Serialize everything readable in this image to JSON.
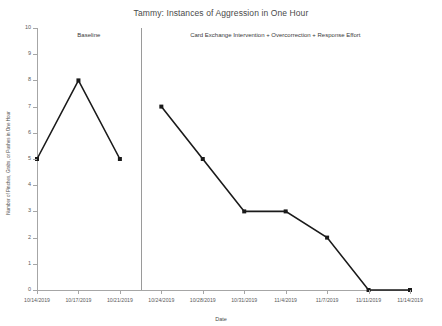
{
  "chart_data": {
    "type": "line",
    "title": "Tammy: Instances of Aggression in One Hour",
    "xlabel": "Date",
    "ylabel": "Number of Pinches, Grabs, or Pushes in One Hour",
    "ylim": [
      0,
      10
    ],
    "yticks": [
      0,
      1,
      2,
      3,
      4,
      5,
      6,
      7,
      8,
      9,
      10
    ],
    "grid": false,
    "legend": "none",
    "marker": "square",
    "line_color": "#1a1a1a",
    "x": [
      "10/14/2019",
      "10/17/2019",
      "10/21/2019",
      "10/24/2019",
      "10/28/2019",
      "10/31/2019",
      "11/4/2019",
      "11/7/2019",
      "11/11/2019",
      "11/14/2019"
    ],
    "categories": [
      "10/14/2019",
      "10/17/2019",
      "10/21/2019",
      "10/24/2019",
      "10/28/2019",
      "10/31/2019",
      "11/4/2019",
      "11/7/2019",
      "11/11/2019",
      "11/14/2019"
    ],
    "values": [
      5,
      8,
      5,
      7,
      5,
      3,
      3,
      2,
      0,
      0
    ],
    "series": [
      {
        "name": "Instances of Aggression",
        "values": [
          5,
          8,
          5,
          7,
          5,
          3,
          3,
          2,
          0,
          0
        ]
      }
    ],
    "phases": [
      {
        "label": "Baseline",
        "points": [
          {
            "x": "10/14/2019",
            "y": 5
          },
          {
            "x": "10/17/2019",
            "y": 8
          },
          {
            "x": "10/21/2019",
            "y": 5
          }
        ]
      },
      {
        "label": "Card Exchange Intervention + Overcorrection + Response Effort",
        "points": [
          {
            "x": "10/24/2019",
            "y": 7
          },
          {
            "x": "10/28/2019",
            "y": 5
          },
          {
            "x": "10/31/2019",
            "y": 3
          },
          {
            "x": "11/4/2019",
            "y": 3
          },
          {
            "x": "11/7/2019",
            "y": 2
          },
          {
            "x": "11/11/2019",
            "y": 0
          },
          {
            "x": "11/14/2019",
            "y": 0
          }
        ]
      }
    ],
    "phase_divider_after": "10/21/2019"
  }
}
